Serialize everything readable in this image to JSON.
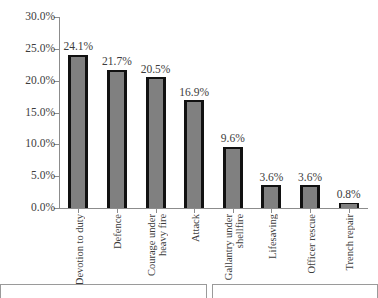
{
  "chart_data": {
    "type": "bar",
    "title": "",
    "subtitle": "",
    "xlabel": "",
    "ylabel": "",
    "categories": [
      "Devotion to duty",
      "Defence",
      "Courage under\nheavy fire",
      "Attack",
      "Gallantry under\nshellfire",
      "Lifesaving",
      "Officer rescue",
      "Trench repair"
    ],
    "values": [
      24.1,
      21.7,
      20.5,
      16.9,
      9.6,
      3.6,
      3.6,
      0.8
    ],
    "data_labels": [
      "24.1%",
      "21.7%",
      "20.5%",
      "16.9%",
      "9.6%",
      "3.6%",
      "3.6%",
      "0.8%"
    ],
    "ylim": [
      0.0,
      30.0
    ],
    "ytick_values": [
      0.0,
      5.0,
      10.0,
      15.0,
      20.0,
      25.0,
      30.0
    ],
    "ytick_labels": [
      "0.0%",
      "5.0%",
      "10.0%",
      "15.0%",
      "20.0%",
      "25.0%",
      "30.0%"
    ],
    "grid": false,
    "legend": false,
    "legend_position": "none",
    "series": [
      {
        "name": "",
        "values": [
          24.1,
          21.7,
          20.5,
          16.9,
          9.6,
          3.6,
          3.6,
          0.8
        ]
      }
    ],
    "colors": {
      "bar_fill": "#808080",
      "bar_edge": "#111111",
      "axis": "#8c8c8c",
      "text": "#3c3c3c",
      "background": "#ffffff"
    }
  },
  "figure": {
    "bottom_panels": [
      {
        "label": ""
      },
      {
        "label": ""
      }
    ]
  }
}
